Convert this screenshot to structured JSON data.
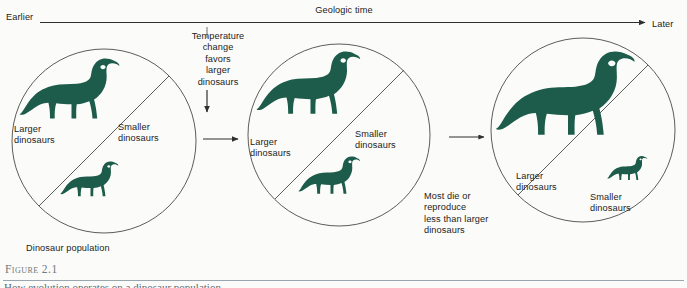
{
  "figure": {
    "number_label": "Figure 2.1",
    "caption_text": "How evolution operates on a dinosaur population",
    "background_color": "#fbfbf9",
    "silhouette_color": "#1d5c4b",
    "line_color": "#3a3a3a"
  },
  "timeline": {
    "start_label": "Earlier",
    "title": "Geologic time",
    "end_label": "Later",
    "arrow_icon": "arrow-right-icon"
  },
  "stages": [
    {
      "id": "stage-1",
      "larger_label": "Larger\ndinosaurs",
      "smaller_label": "Smaller\ndinosaurs",
      "caption": "Dinosaur population",
      "large_dinosaur_scale": 1.0,
      "small_dinosaur_scale": 0.58
    },
    {
      "id": "stage-2",
      "larger_label": "Larger\ndinosaurs",
      "smaller_label": "Smaller\ndinosaurs",
      "large_dinosaur_scale": 1.05,
      "small_dinosaur_scale": 0.62
    },
    {
      "id": "stage-3",
      "larger_label": "Larger\ndinosaurs",
      "smaller_label": "Smaller\ndinosaurs",
      "large_dinosaur_scale": 1.45,
      "small_dinosaur_scale": 0.36
    }
  ],
  "steps": [
    {
      "id": "step-1",
      "text": "Temperature\nchange\nfavors\nlarger\ndinosaurs",
      "down_arrow_icon": "arrow-down-icon",
      "flow_arrow_icon": "arrow-right-icon"
    },
    {
      "id": "step-2",
      "text": "Most die or\nreproduce\nless than larger\ndinosaurs",
      "flow_arrow_icon": "arrow-right-icon"
    }
  ]
}
